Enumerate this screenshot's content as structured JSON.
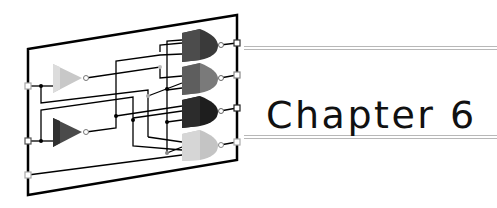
{
  "heading": {
    "title": "Chapter 6"
  },
  "illustration": {
    "description": "logic circuit board with 2 buffer/inverter gates and 4 AND gates",
    "gate_colors": {
      "and_gate_1": "#3a3a3a",
      "and_gate_2": "#7a7a7a",
      "and_gate_3": "#1e1e1e",
      "and_gate_4": "#c4c4c4",
      "buffer_1": "#c8c8c8",
      "buffer_2": "#4a4a4a"
    },
    "frame_color": "#000000"
  },
  "colors": {
    "rule": "#b8b8b8",
    "text": "#111111",
    "background": "#ffffff"
  }
}
